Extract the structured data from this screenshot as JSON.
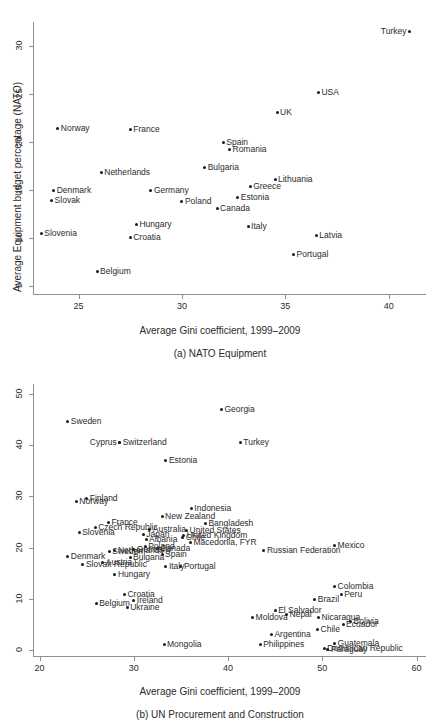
{
  "figure": {
    "panels": [
      {
        "id": "panel-a",
        "caption": "(a) NATO Equipment",
        "chart_data": {
          "type": "scatter",
          "title": "",
          "xlabel": "Average Gini coefficient, 1999–2009",
          "ylabel": "Average Equipment budget percentage (NATO)",
          "xlim": [
            22.8,
            41.8
          ],
          "ylim": [
            4.2,
            32.5
          ],
          "xticks": [
            25,
            30,
            35,
            40
          ],
          "yticks": [
            5,
            10,
            15,
            20,
            25,
            30
          ],
          "grid": false,
          "legend": "none",
          "points": [
            {
              "label": "Turkey",
              "x": 41.0,
              "y": 31.5,
              "side": "left"
            },
            {
              "label": "USA",
              "x": 36.6,
              "y": 25.2,
              "side": "right"
            },
            {
              "label": "UK",
              "x": 34.6,
              "y": 23.1,
              "side": "right"
            },
            {
              "label": "Norway",
              "x": 24.0,
              "y": 21.4,
              "side": "right"
            },
            {
              "label": "France",
              "x": 27.5,
              "y": 21.3,
              "side": "right"
            },
            {
              "label": "Spain",
              "x": 32.0,
              "y": 20.0,
              "side": "right"
            },
            {
              "label": "Romania",
              "x": 32.3,
              "y": 19.2,
              "side": "right"
            },
            {
              "label": "Bulgaria",
              "x": 31.1,
              "y": 17.4,
              "side": "right"
            },
            {
              "label": "Netherlands",
              "x": 26.1,
              "y": 16.8,
              "side": "right"
            },
            {
              "label": "Lithuania",
              "x": 34.5,
              "y": 16.1,
              "side": "right"
            },
            {
              "label": "Greece",
              "x": 33.3,
              "y": 15.4,
              "side": "right"
            },
            {
              "label": "Denmark",
              "x": 23.8,
              "y": 15.0,
              "side": "right"
            },
            {
              "label": "Germany",
              "x": 28.5,
              "y": 15.0,
              "side": "right"
            },
            {
              "label": "Estonia",
              "x": 32.7,
              "y": 14.2,
              "side": "right"
            },
            {
              "label": "Slovak",
              "x": 23.7,
              "y": 13.9,
              "side": "right"
            },
            {
              "label": "Poland",
              "x": 30.0,
              "y": 13.8,
              "side": "right"
            },
            {
              "label": "Canada",
              "x": 31.7,
              "y": 13.1,
              "side": "right"
            },
            {
              "label": "Hungary",
              "x": 27.8,
              "y": 11.4,
              "side": "right"
            },
            {
              "label": "Italy",
              "x": 33.2,
              "y": 11.2,
              "side": "right"
            },
            {
              "label": "Slovenia",
              "x": 23.2,
              "y": 10.5,
              "side": "right"
            },
            {
              "label": "Latvia",
              "x": 36.5,
              "y": 10.3,
              "side": "right"
            },
            {
              "label": "Croatia",
              "x": 27.5,
              "y": 10.1,
              "side": "right"
            },
            {
              "label": "Portugal",
              "x": 35.4,
              "y": 8.3,
              "side": "right"
            },
            {
              "label": "Belgium",
              "x": 25.9,
              "y": 6.5,
              "side": "right"
            }
          ]
        }
      },
      {
        "id": "panel-b",
        "caption": "(b) UN Procurement and Construction",
        "chart_data": {
          "type": "scatter",
          "title": "",
          "xlabel": "Average Gini coefficient, 1999–2009",
          "ylabel": "",
          "xlim": [
            19.3,
            61.0
          ],
          "ylim": [
            -1.2,
            52.0
          ],
          "xticks": [
            20,
            30,
            40,
            50,
            60
          ],
          "yticks": [
            0,
            10,
            20,
            30,
            40,
            50
          ],
          "grid": false,
          "legend": "none",
          "points": [
            {
              "label": "Georgia",
              "x": 39.3,
              "y": 47.0,
              "side": "right"
            },
            {
              "label": "Sweden",
              "x": 23.0,
              "y": 44.6,
              "side": "right"
            },
            {
              "label": "Switzerland",
              "x": 28.5,
              "y": 40.5,
              "side": "right"
            },
            {
              "label": "Cyprus",
              "x": 28.5,
              "y": 40.5,
              "side": "left"
            },
            {
              "label": "Turkey",
              "x": 41.3,
              "y": 40.6,
              "side": "right"
            },
            {
              "label": "Estonia",
              "x": 33.4,
              "y": 37.0,
              "side": "right"
            },
            {
              "label": "Finland",
              "x": 25.0,
              "y": 29.7,
              "side": "right"
            },
            {
              "label": "Norway",
              "x": 23.9,
              "y": 29.0,
              "side": "right"
            },
            {
              "label": "Indonesia",
              "x": 36.1,
              "y": 27.7,
              "side": "right"
            },
            {
              "label": "New Zealand",
              "x": 33.0,
              "y": 26.0,
              "side": "right"
            },
            {
              "label": "France",
              "x": 27.3,
              "y": 25.0,
              "side": "right"
            },
            {
              "label": "Bangladesh",
              "x": 37.6,
              "y": 24.7,
              "side": "right"
            },
            {
              "label": "Czech Republic",
              "x": 25.9,
              "y": 24.0,
              "side": "right"
            },
            {
              "label": "Australia",
              "x": 31.7,
              "y": 23.5,
              "side": "right"
            },
            {
              "label": "United States",
              "x": 35.6,
              "y": 23.3,
              "side": "right"
            },
            {
              "label": "Slovenia",
              "x": 24.2,
              "y": 23.0,
              "side": "right"
            },
            {
              "label": "Japan",
              "x": 31.0,
              "y": 22.5,
              "side": "right"
            },
            {
              "label": "United Kingdom",
              "x": 35.3,
              "y": 22.4,
              "side": "right"
            },
            {
              "label": "Albania",
              "x": 31.3,
              "y": 21.5,
              "side": "right"
            },
            {
              "label": "Chile",
              "x": 35.2,
              "y": 22.0,
              "side": "right"
            },
            {
              "label": "Macedonia, FYR",
              "x": 36.0,
              "y": 21.0,
              "side": "right"
            },
            {
              "label": "Mexico",
              "x": 51.3,
              "y": 20.4,
              "side": "right"
            },
            {
              "label": "Poland",
              "x": 31.2,
              "y": 20.3,
              "side": "right"
            },
            {
              "label": "Canada",
              "x": 32.5,
              "y": 19.8,
              "side": "right"
            },
            {
              "label": "Germany",
              "x": 30.0,
              "y": 19.6,
              "side": "right"
            },
            {
              "label": "Netherlands",
              "x": 28.0,
              "y": 19.5,
              "side": "right"
            },
            {
              "label": "Russian Federation",
              "x": 43.8,
              "y": 19.4,
              "side": "right"
            },
            {
              "label": "Sweden2",
              "x": 27.4,
              "y": 19.2,
              "side": "right"
            },
            {
              "label": "Spain",
              "x": 33.0,
              "y": 18.7,
              "side": "right"
            },
            {
              "label": "Denmark",
              "x": 23.0,
              "y": 18.2,
              "side": "right"
            },
            {
              "label": "Bulgaria",
              "x": 29.6,
              "y": 18.0,
              "side": "right"
            },
            {
              "label": "Austria",
              "x": 26.7,
              "y": 17.0,
              "side": "right"
            },
            {
              "label": "Slovak Republic",
              "x": 24.6,
              "y": 16.6,
              "side": "right"
            },
            {
              "label": "Italy",
              "x": 33.4,
              "y": 16.4,
              "side": "right"
            },
            {
              "label": "Portugal",
              "x": 35.0,
              "y": 16.3,
              "side": "right"
            },
            {
              "label": "Hungary",
              "x": 28.0,
              "y": 14.7,
              "side": "right"
            },
            {
              "label": "Colombia",
              "x": 51.3,
              "y": 12.3,
              "side": "right"
            },
            {
              "label": "Peru",
              "x": 52.0,
              "y": 10.8,
              "side": "right"
            },
            {
              "label": "Croatia",
              "x": 29.0,
              "y": 10.8,
              "side": "right"
            },
            {
              "label": "Brazil",
              "x": 49.2,
              "y": 9.8,
              "side": "right"
            },
            {
              "label": "Ireland",
              "x": 30.0,
              "y": 9.6,
              "side": "right"
            },
            {
              "label": "Belgium",
              "x": 26.0,
              "y": 9.0,
              "side": "right"
            },
            {
              "label": "Ukraine",
              "x": 29.3,
              "y": 8.3,
              "side": "right"
            },
            {
              "label": "El Salvador",
              "x": 45.0,
              "y": 7.7,
              "side": "right"
            },
            {
              "label": "Nepal",
              "x": 46.2,
              "y": 7.0,
              "side": "right"
            },
            {
              "label": "Moldova",
              "x": 42.6,
              "y": 6.4,
              "side": "right"
            },
            {
              "label": "Nicaragua",
              "x": 49.6,
              "y": 6.3,
              "side": "right"
            },
            {
              "label": "Bolivia",
              "x": 53.0,
              "y": 5.6,
              "side": "right"
            },
            {
              "label": "Ecuador",
              "x": 52.2,
              "y": 5.0,
              "side": "right"
            },
            {
              "label": "Chile2",
              "x": 49.5,
              "y": 4.0,
              "side": "right"
            },
            {
              "label": "Argentina",
              "x": 44.6,
              "y": 3.0,
              "side": "right"
            },
            {
              "label": "Guatemala",
              "x": 51.3,
              "y": 1.2,
              "side": "right"
            },
            {
              "label": "Philippines",
              "x": 43.4,
              "y": 1.0,
              "side": "right"
            },
            {
              "label": "Mongolia",
              "x": 33.2,
              "y": 1.0,
              "side": "right"
            },
            {
              "label": "Dominican Republic",
              "x": 50.2,
              "y": 0.3,
              "side": "right"
            },
            {
              "label": "Paraguay",
              "x": 50.6,
              "y": 0.1,
              "side": "right"
            }
          ]
        }
      }
    ]
  }
}
